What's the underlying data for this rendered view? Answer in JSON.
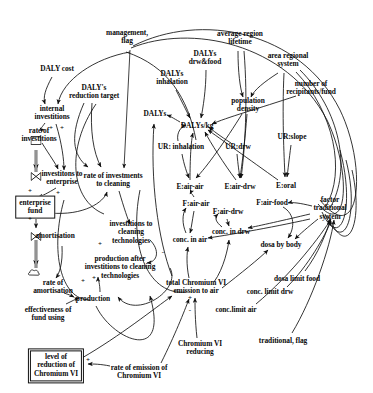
{
  "diagram": {
    "type": "causal-loop-stock-flow",
    "background_color": "#ffffff",
    "line_color": "#111111"
  },
  "nodes": [
    {
      "id": "daly_cost",
      "label": "DALY cost",
      "x": 57,
      "y": 69,
      "style": "plain"
    },
    {
      "id": "management_flag",
      "label": "management,\nflag",
      "x": 127,
      "y": 37,
      "style": "plain"
    },
    {
      "id": "dalys_reduction",
      "label": "DALY's\nreduction target",
      "x": 94,
      "y": 92,
      "style": "plain"
    },
    {
      "id": "dalys_inhalation",
      "label": "DALYs\ninhalation",
      "x": 172,
      "y": 78,
      "style": "plain"
    },
    {
      "id": "dalys_drw_food",
      "label": "DALYs\ndrw&food",
      "x": 205,
      "y": 58,
      "style": "plain"
    },
    {
      "id": "avg_region_lifetime",
      "label": "average region\nlifetime",
      "x": 240,
      "y": 38,
      "style": "plain"
    },
    {
      "id": "area_regional_system",
      "label": "area regional\nsystem",
      "x": 288,
      "y": 60,
      "style": "plain"
    },
    {
      "id": "num_recipitants",
      "label": "number of\nrecipitants/fund",
      "x": 311,
      "y": 88,
      "style": "plain"
    },
    {
      "id": "population_density",
      "label": "population\ndensity",
      "x": 248,
      "y": 105,
      "style": "plain"
    },
    {
      "id": "dalys",
      "label": "DALYs",
      "x": 155,
      "y": 114,
      "style": "plain"
    },
    {
      "id": "dalys_kg",
      "label": "DALYs/kg",
      "x": 197,
      "y": 126,
      "style": "plain"
    },
    {
      "id": "ur_inhalation",
      "label": "UR: inhalation",
      "x": 181,
      "y": 147,
      "style": "plain"
    },
    {
      "id": "ur_drw",
      "label": "UR:drw",
      "x": 238,
      "y": 147,
      "style": "plain"
    },
    {
      "id": "ur_slope",
      "label": "UR:slope",
      "x": 292,
      "y": 137,
      "style": "plain"
    },
    {
      "id": "e_air_air",
      "label": "E:air-air",
      "x": 190,
      "y": 187,
      "style": "plain"
    },
    {
      "id": "e_air_drw",
      "label": "E:air-drw",
      "x": 240,
      "y": 187,
      "style": "plain"
    },
    {
      "id": "e_oral",
      "label": "E:oral",
      "x": 286,
      "y": 186,
      "style": "plain"
    },
    {
      "id": "f_air_air",
      "label": "F:air-air",
      "x": 196,
      "y": 204,
      "style": "plain"
    },
    {
      "id": "f_air_drw",
      "label": "F:air-drw",
      "x": 228,
      "y": 212,
      "style": "plain"
    },
    {
      "id": "f_air_food",
      "label": "F:air-food",
      "x": 272,
      "y": 203,
      "style": "plain"
    },
    {
      "id": "factor_traditional",
      "label": "factor traditional\nsystem",
      "x": 330,
      "y": 209,
      "style": "plain"
    },
    {
      "id": "internal_investitions",
      "label": "internal\ninvestitions",
      "x": 52,
      "y": 113,
      "style": "plain"
    },
    {
      "id": "rate_of_investitions",
      "label": "rate of\ninvestitions",
      "x": 39,
      "y": 135,
      "style": "plain"
    },
    {
      "id": "investitons_enterprise",
      "label": "investitons to\nenterprise",
      "x": 62,
      "y": 178,
      "style": "plain"
    },
    {
      "id": "rate_inv_cleaning",
      "label": "rate of investments\nto cleaning",
      "x": 113,
      "y": 180,
      "style": "plain"
    },
    {
      "id": "enterprise_fund",
      "label": "enterprise\nfund",
      "x": 35,
      "y": 207,
      "style": "boxed"
    },
    {
      "id": "amortisation",
      "label": "amortisation",
      "x": 55,
      "y": 236,
      "style": "plain"
    },
    {
      "id": "rate_amortisation",
      "label": "rate of\namortisation",
      "x": 53,
      "y": 287,
      "style": "plain"
    },
    {
      "id": "effectiveness_fund",
      "label": "effectiveness of\nfund using",
      "x": 48,
      "y": 314,
      "style": "plain"
    },
    {
      "id": "production",
      "label": "production",
      "x": 93,
      "y": 299,
      "style": "plain"
    },
    {
      "id": "invest_clean_tech",
      "label": "investitions to\ncleaning\ntechnologies",
      "x": 131,
      "y": 233,
      "style": "plain"
    },
    {
      "id": "prod_after_invest",
      "label": "production after\ninvestitions to cleaning\ntechnologies",
      "x": 120,
      "y": 268,
      "style": "plain"
    },
    {
      "id": "conc_in_air",
      "label": "conc. in air",
      "x": 190,
      "y": 240,
      "style": "plain"
    },
    {
      "id": "conc_in_drw",
      "label": "conc. in drw",
      "x": 231,
      "y": 232,
      "style": "plain"
    },
    {
      "id": "dosa_by_body",
      "label": "dosa by body",
      "x": 281,
      "y": 245,
      "style": "plain"
    },
    {
      "id": "dosa_limit_food",
      "label": "dosa limit food",
      "x": 297,
      "y": 279,
      "style": "plain"
    },
    {
      "id": "conc_limit_drw",
      "label": "conc. limit drw",
      "x": 270,
      "y": 292,
      "style": "plain"
    },
    {
      "id": "conc_limit_air",
      "label": "conc.limit air",
      "x": 236,
      "y": 310,
      "style": "plain"
    },
    {
      "id": "total_emission",
      "label": "total Chromium VI\nemission to air",
      "x": 196,
      "y": 287,
      "style": "plain"
    },
    {
      "id": "chromium_reducing",
      "label": "Chromium VI\nreducing",
      "x": 200,
      "y": 348,
      "style": "plain"
    },
    {
      "id": "traditional_flag",
      "label": "traditional, flag",
      "x": 283,
      "y": 341,
      "style": "plain"
    },
    {
      "id": "rate_of_emission",
      "label": "rate of emission of\nChromium VI",
      "x": 139,
      "y": 372,
      "style": "plain"
    },
    {
      "id": "level_reduction",
      "label": "level of\nreduction of\nChromium VI",
      "x": 56,
      "y": 366,
      "style": "dbl"
    }
  ],
  "signs": [
    {
      "id": "s1",
      "text": "+",
      "x": 51,
      "y": 128
    },
    {
      "id": "s2",
      "text": "+",
      "x": 62,
      "y": 128
    },
    {
      "id": "s3",
      "text": "+",
      "x": 30,
      "y": 191
    },
    {
      "id": "s4",
      "text": "+",
      "x": 58,
      "y": 193
    },
    {
      "id": "s5",
      "text": "+",
      "x": 30,
      "y": 219
    },
    {
      "id": "s6",
      "text": "+",
      "x": 100,
      "y": 244
    },
    {
      "id": "s7",
      "text": "-",
      "x": 163,
      "y": 252
    },
    {
      "id": "s8",
      "text": "+",
      "x": 83,
      "y": 281
    },
    {
      "id": "s9",
      "text": "+",
      "x": 94,
      "y": 278
    },
    {
      "id": "s10",
      "text": "+",
      "x": 190,
      "y": 298
    },
    {
      "id": "s11",
      "text": "-",
      "x": 190,
      "y": 310
    },
    {
      "id": "s12",
      "text": "+",
      "x": 88,
      "y": 360
    }
  ],
  "flows": [
    {
      "id": "valve-investitions",
      "x": 36,
      "y": 147
    },
    {
      "id": "valve-enterprise-in",
      "x": 36,
      "y": 176
    },
    {
      "id": "valve-amortisation",
      "x": 36,
      "y": 236
    },
    {
      "id": "cloud-amortisation-sink",
      "x": 34,
      "y": 273
    }
  ]
}
